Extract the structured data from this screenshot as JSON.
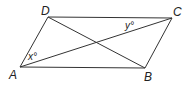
{
  "diagram": {
    "type": "parallelogram",
    "vertices": {
      "A": {
        "label": "A",
        "x": 20,
        "y": 67
      },
      "B": {
        "label": "B",
        "x": 145,
        "y": 68
      },
      "C": {
        "label": "C",
        "x": 172,
        "y": 18
      },
      "D": {
        "label": "D",
        "x": 48,
        "y": 17
      }
    },
    "diagonals": [
      "AC",
      "BD"
    ],
    "angles": {
      "x": {
        "label": "x°",
        "at": "A",
        "between": [
          "AD",
          "AC"
        ]
      },
      "y": {
        "label": "y°",
        "at": "C",
        "between": [
          "CA",
          "CD"
        ]
      }
    },
    "stroke_color": "#333333"
  }
}
